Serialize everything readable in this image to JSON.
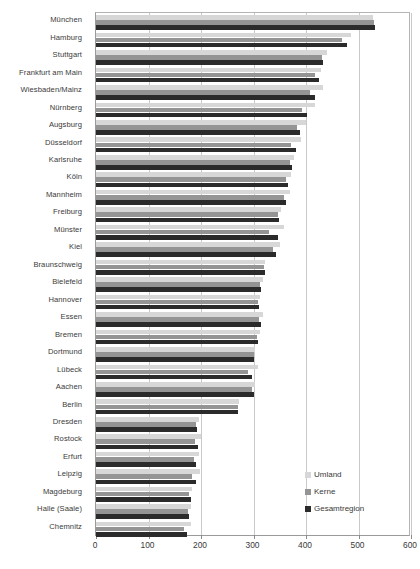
{
  "chart_data": {
    "type": "bar",
    "orientation": "horizontal",
    "title": "",
    "subtitle": "",
    "xlabel": "",
    "ylabel": "",
    "xlim": [
      0,
      600
    ],
    "xticks": [
      0,
      100,
      200,
      300,
      400,
      500,
      600
    ],
    "xtick_labels": [
      "0",
      "100",
      "200",
      "300",
      "400",
      "500",
      "600"
    ],
    "grid": "vertical",
    "legend_position": "bottom-right",
    "legend": [
      "Umland",
      "Kerne",
      "Gesamtregion"
    ],
    "series_colors": {
      "Umland": "#d7d7d7",
      "Kerne": "#949494",
      "Gesamtregion": "#2b2b2b"
    },
    "categories": [
      "München",
      "Hamburg",
      "Stuttgart",
      "Frankfurt am Main",
      "Wiesbaden/Mainz",
      "Nürnberg",
      "Augsburg",
      "Düsseldorf",
      "Karlsruhe",
      "Köln",
      "Mannheim",
      "Freiburg",
      "Münster",
      "Kiel",
      "Braunschweig",
      "Bielefeld",
      "Hannover",
      "Essen",
      "Bremen",
      "Dortmund",
      "Lübeck",
      "Aachen",
      "Berlin",
      "Dresden",
      "Rostock",
      "Erfurt",
      "Leipzig",
      "Magdeburg",
      "Halle (Saale)",
      "Chemnitz"
    ],
    "series": [
      {
        "name": "Umland",
        "values": [
          528,
          485,
          440,
          428,
          432,
          418,
          400,
          390,
          378,
          372,
          370,
          352,
          358,
          350,
          322,
          318,
          312,
          318,
          312,
          302,
          308,
          302,
          272,
          196,
          200,
          196,
          198,
          182,
          180,
          180
        ]
      },
      {
        "name": "Kerne",
        "values": [
          530,
          468,
          430,
          418,
          408,
          392,
          382,
          372,
          370,
          362,
          358,
          346,
          330,
          338,
          320,
          312,
          308,
          310,
          306,
          300,
          290,
          298,
          270,
          190,
          188,
          186,
          182,
          178,
          176,
          168
        ]
      },
      {
        "name": "Gesamtregion",
        "values": [
          532,
          478,
          432,
          424,
          418,
          402,
          388,
          380,
          374,
          366,
          362,
          348,
          346,
          342,
          321,
          314,
          310,
          314,
          308,
          301,
          298,
          300,
          271,
          192,
          194,
          190,
          190,
          180,
          178,
          174
        ]
      }
    ]
  }
}
